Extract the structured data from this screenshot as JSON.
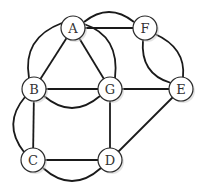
{
  "graph": {
    "nodes": [
      {
        "id": "A",
        "label": "A",
        "x": 73,
        "y": 28
      },
      {
        "id": "F",
        "label": "F",
        "x": 145,
        "y": 28
      },
      {
        "id": "B",
        "label": "B",
        "x": 34,
        "y": 89
      },
      {
        "id": "G",
        "label": "G",
        "x": 110,
        "y": 89
      },
      {
        "id": "E",
        "label": "E",
        "x": 181,
        "y": 89
      },
      {
        "id": "C",
        "label": "C",
        "x": 33,
        "y": 160
      },
      {
        "id": "D",
        "label": "D",
        "x": 110,
        "y": 160
      }
    ],
    "edges": [
      {
        "from": "A",
        "to": "F",
        "type": "straight"
      },
      {
        "from": "A",
        "to": "F",
        "type": "arc-above"
      },
      {
        "from": "A",
        "to": "B",
        "type": "straight"
      },
      {
        "from": "A",
        "to": "B",
        "type": "arc-left"
      },
      {
        "from": "A",
        "to": "G",
        "type": "straight"
      },
      {
        "from": "A",
        "to": "G",
        "type": "arc-right"
      },
      {
        "from": "B",
        "to": "G",
        "type": "straight"
      },
      {
        "from": "B",
        "to": "G",
        "type": "arc-below"
      },
      {
        "from": "G",
        "to": "E",
        "type": "straight"
      },
      {
        "from": "F",
        "to": "E",
        "type": "arc-left"
      },
      {
        "from": "F",
        "to": "E",
        "type": "arc-right"
      },
      {
        "from": "B",
        "to": "C",
        "type": "straight"
      },
      {
        "from": "B",
        "to": "C",
        "type": "arc-left"
      },
      {
        "from": "C",
        "to": "D",
        "type": "straight"
      },
      {
        "from": "C",
        "to": "D",
        "type": "arc-below"
      },
      {
        "from": "G",
        "to": "D",
        "type": "straight"
      },
      {
        "from": "D",
        "to": "E",
        "type": "straight"
      }
    ],
    "colors": {
      "edge": "#1a1a1a",
      "node_fill": "#ffffff",
      "node_stroke": "#2a2a2a",
      "label": "#333333"
    }
  }
}
